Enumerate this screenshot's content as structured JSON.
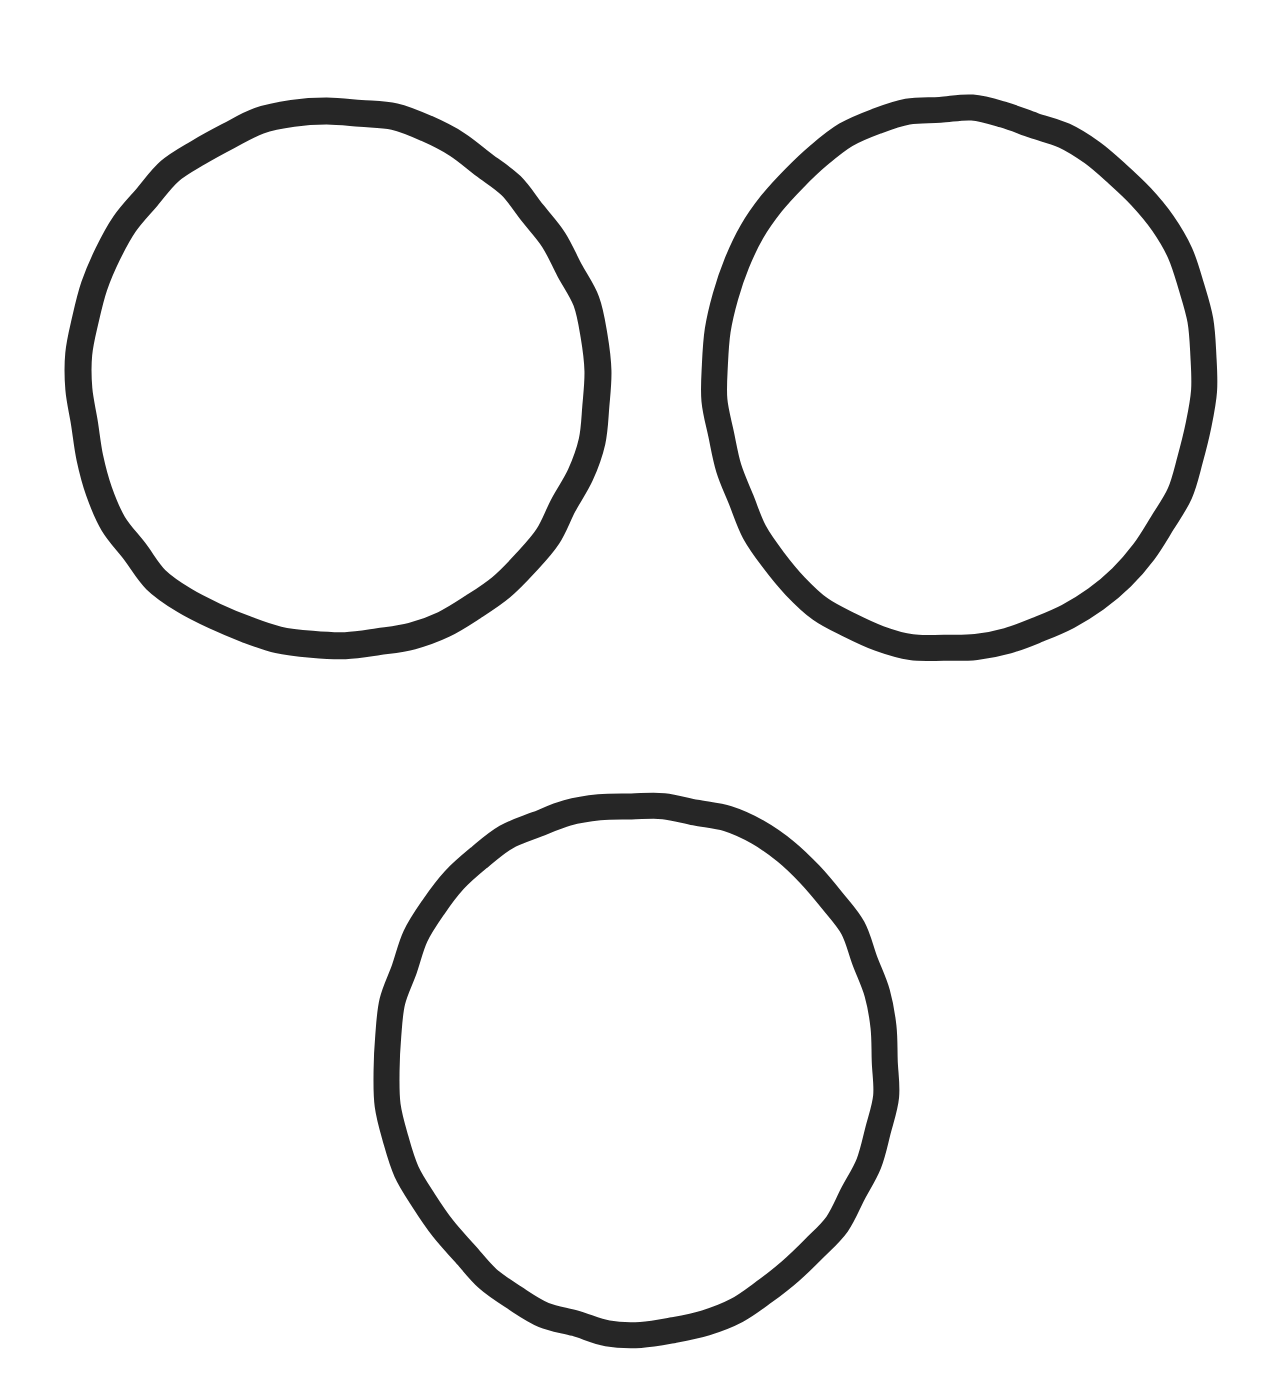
{
  "document": {
    "title": "Three Hand-Drawn Circles",
    "kind": "line-drawing",
    "canvas": {
      "width": 1275,
      "height": 1376,
      "background_color": "#ffffff"
    }
  },
  "style": {
    "stroke_color": "#262626",
    "stroke_width": 26,
    "fill": "none"
  },
  "shapes": [
    {
      "id": "circle-top-left",
      "label": "Top-left circle",
      "type": "circle",
      "center_x": 336,
      "center_y": 380,
      "radius_x": 259,
      "radius_y": 268,
      "rotation": -2,
      "stroke_color": "#262626",
      "stroke_width": 27
    },
    {
      "id": "circle-top-right",
      "label": "Top-right circle",
      "type": "circle",
      "center_x": 958,
      "center_y": 378,
      "radius_x": 246,
      "radius_y": 270,
      "rotation": 3,
      "stroke_color": "#262626",
      "stroke_width": 26
    },
    {
      "id": "circle-bottom-center",
      "label": "Bottom-center circle",
      "type": "circle",
      "center_x": 636,
      "center_y": 1066,
      "radius_x": 250,
      "radius_y": 265,
      "rotation": -1,
      "stroke_color": "#262626",
      "stroke_width": 26
    }
  ],
  "layout": {
    "arrangement": "triangular",
    "count": 3,
    "count_label": "3"
  }
}
